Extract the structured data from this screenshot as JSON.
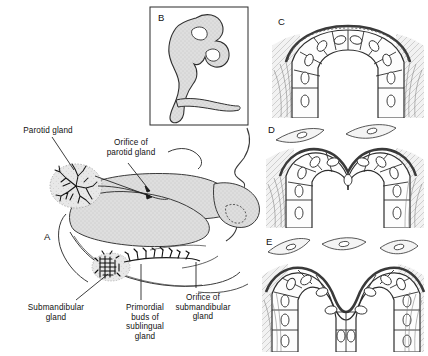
{
  "figure": {
    "background_color": "#ffffff",
    "ink_color": "#1a1a1a",
    "tissue_fill": "#dcdcdc",
    "epithelium_fill": "#fdfdfd",
    "width": 428,
    "height": 356
  },
  "panels": [
    {
      "id": "A",
      "letter": "A",
      "x": 44,
      "y": 238,
      "caption": "Sagittal section of the embryonic head showing sites of the developing salivary glands"
    },
    {
      "id": "B",
      "letter": "B",
      "x": 158,
      "y": 18,
      "caption": "Branching epithelial bud of a developing gland",
      "boxed": true
    },
    {
      "id": "C",
      "letter": "C",
      "x": 278,
      "y": 22,
      "caption": "Early epithelial bud, histological section"
    },
    {
      "id": "D",
      "letter": "D",
      "x": 268,
      "y": 131,
      "caption": "Bud beginning to cleft, histological section"
    },
    {
      "id": "E",
      "letter": "E",
      "x": 266,
      "y": 244,
      "caption": "Deep cleft dividing the bud into two lobes, histological section"
    }
  ],
  "labels": [
    {
      "id": "parotid-gland",
      "text": "Parotid gland",
      "x": 8,
      "y": 126,
      "width": 80,
      "align": "center"
    },
    {
      "id": "orifice-of-parotid-gland",
      "text": "Orifice of\nparotid gland",
      "x": 92,
      "y": 138,
      "width": 78,
      "align": "center"
    },
    {
      "id": "submandibular-gland",
      "text": "Submandibular\ngland",
      "x": 18,
      "y": 303,
      "width": 76,
      "align": "center"
    },
    {
      "id": "primordial-buds-of-sublingual-gland",
      "text": "Primordial\nbuds of\nsublingual\ngland",
      "x": 117,
      "y": 303,
      "width": 56,
      "align": "center"
    },
    {
      "id": "orifice-of-submandibular-gland",
      "text": "Orifice of\nsubmandibular\ngland",
      "x": 168,
      "y": 293,
      "width": 70,
      "align": "center"
    }
  ],
  "leader_lines": [
    {
      "id": "leader-parotid",
      "from": [
        52,
        137
      ],
      "to": [
        74,
        172
      ]
    },
    {
      "id": "leader-orifice-parotid",
      "from": [
        128,
        163
      ],
      "to": [
        152,
        192
      ]
    },
    {
      "id": "leader-submandibular",
      "from": [
        75,
        300
      ],
      "to": [
        110,
        272
      ]
    },
    {
      "id": "leader-sublingual-buds",
      "from": [
        141,
        300
      ],
      "to": [
        141,
        263
      ]
    },
    {
      "id": "leader-orifice-submandibular",
      "from": [
        196,
        290
      ],
      "to": [
        196,
        262
      ]
    }
  ]
}
